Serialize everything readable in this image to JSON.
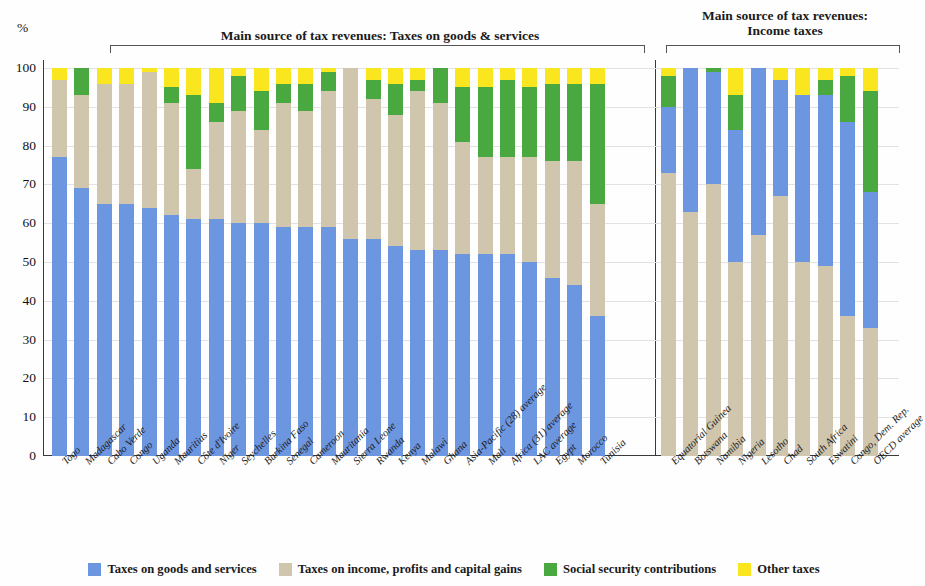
{
  "headers": {
    "goods": "Main source of tax revenues: Taxes on goods & services",
    "income": "Main source of tax revenues:\nIncome taxes",
    "income_line1": "Main source of tax revenues:",
    "income_line2": "Income taxes"
  },
  "axis": {
    "unit": "%",
    "ticks": [
      "100",
      "90",
      "80",
      "70",
      "60",
      "50",
      "40",
      "30",
      "20",
      "10",
      "0"
    ],
    "min": 0,
    "max": 100
  },
  "legend": [
    {
      "label": "Taxes on goods and services",
      "color": "#6d96e0"
    },
    {
      "label": "Taxes on income, profits and capital gains",
      "color": "#cfc6ad"
    },
    {
      "label": "Social security contributions",
      "color": "#49a83f"
    },
    {
      "label": "Other taxes",
      "color": "#fae61e"
    }
  ],
  "chart_data": {
    "type": "bar",
    "subtype": "stacked-100",
    "xlabel": "",
    "ylabel": "%",
    "ylim": [
      0,
      100
    ],
    "grid": true,
    "legend_position": "bottom",
    "series_names": [
      "Taxes on goods and services",
      "Taxes on income, profits and capital gains",
      "Social security contributions",
      "Other taxes"
    ],
    "series_colors": [
      "#6d96e0",
      "#cfc6ad",
      "#49a83f",
      "#fae61e"
    ],
    "groups": [
      {
        "name": "Main source of tax revenues: Taxes on goods & services",
        "stack_order": [
          "goods",
          "income",
          "social",
          "other"
        ],
        "categories": [
          "Togo",
          "Madagascar",
          "Cabo Verde",
          "Congo",
          "Uganda",
          "Mauritius",
          "Côte d'Ivoire",
          "Niger",
          "Seychelles",
          "Burkina Faso",
          "Senegal",
          "Cameroon",
          "Mauritania",
          "Sierra Leone",
          "Rwanda",
          "Kenya",
          "Malawi",
          "Ghana",
          "Asia-Pacific (28) average",
          "Mali",
          "Africa (31) average",
          "LAC average",
          "Egypt",
          "Morocco",
          "Tunisia"
        ],
        "goods": [
          77,
          69,
          65,
          65,
          64,
          62,
          61,
          61,
          60,
          60,
          59,
          59,
          59,
          56,
          56,
          54,
          53,
          53,
          52,
          52,
          52,
          50,
          46,
          44,
          36
        ],
        "income": [
          20,
          24,
          31,
          31,
          35,
          29,
          13,
          25,
          29,
          24,
          32,
          30,
          35,
          44,
          36,
          34,
          41,
          38,
          29,
          25,
          25,
          27,
          30,
          32,
          29
        ],
        "other": [
          3,
          0,
          4,
          4,
          1,
          5,
          7,
          9,
          2,
          6,
          4,
          4,
          1,
          0,
          3,
          4,
          3,
          0,
          5,
          5,
          3,
          5,
          4,
          4,
          4
        ],
        "social": [
          0,
          7,
          0,
          0,
          0,
          4,
          19,
          5,
          9,
          10,
          5,
          7,
          5,
          0,
          5,
          8,
          3,
          9,
          14,
          18,
          20,
          18,
          20,
          20,
          31
        ]
      },
      {
        "name": "Main source of tax revenues: Income taxes",
        "stack_order": [
          "income",
          "goods",
          "social",
          "other"
        ],
        "categories": [
          "Equatorial Guinea",
          "Botswana",
          "Namibia",
          "Nigeria",
          "Lesotho",
          "Chad",
          "South Africa",
          "Eswatini",
          "Congo, Dem. Rep.",
          "OECD average"
        ],
        "income": [
          73,
          63,
          70,
          50,
          57,
          67,
          50,
          49,
          36,
          33
        ],
        "goods": [
          17,
          37,
          29,
          34,
          43,
          30,
          43,
          44,
          50,
          35
        ],
        "social": [
          8,
          0,
          1,
          9,
          0,
          0,
          0,
          4,
          12,
          26
        ],
        "other": [
          2,
          0,
          0,
          7,
          0,
          3,
          7,
          3,
          2,
          6
        ]
      }
    ]
  }
}
